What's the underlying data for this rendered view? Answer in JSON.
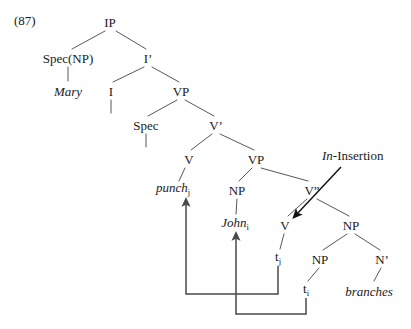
{
  "figure": {
    "example_number": "(87)",
    "kind": "syntax-tree",
    "annotation_label_italic": "In",
    "annotation_label_rest": "-Insertion"
  },
  "colors": {
    "background": "#ffffff",
    "ink": "#1a1a1a",
    "branch_line": "#444444",
    "movement_arrow": "#4a4a4a",
    "insertion_arrow": "#111111"
  },
  "tree": {
    "nodes": [
      {
        "id": "ip",
        "label": "IP",
        "x": 110,
        "y": 22,
        "italic": false,
        "sub": ""
      },
      {
        "id": "specnp",
        "label": "Spec(NP)",
        "x": 68,
        "y": 58,
        "italic": false,
        "sub": ""
      },
      {
        "id": "ibar",
        "label": "I’",
        "x": 148,
        "y": 58,
        "italic": false,
        "sub": ""
      },
      {
        "id": "mary",
        "label": "Mary",
        "x": 68,
        "y": 91,
        "italic": true,
        "sub": ""
      },
      {
        "id": "i",
        "label": "I",
        "x": 111,
        "y": 91,
        "italic": false,
        "sub": ""
      },
      {
        "id": "vp1",
        "label": "VP",
        "x": 181,
        "y": 91,
        "italic": false,
        "sub": ""
      },
      {
        "id": "spec",
        "label": "Spec",
        "x": 146,
        "y": 125,
        "italic": false,
        "sub": ""
      },
      {
        "id": "vbar",
        "label": "V’",
        "x": 216,
        "y": 125,
        "italic": false,
        "sub": ""
      },
      {
        "id": "v1",
        "label": "V",
        "x": 189,
        "y": 159,
        "italic": false,
        "sub": ""
      },
      {
        "id": "vp2",
        "label": "VP",
        "x": 256,
        "y": 159,
        "italic": false,
        "sub": ""
      },
      {
        "id": "punch",
        "label": "punch",
        "x": 173,
        "y": 190,
        "italic": true,
        "sub": "j"
      },
      {
        "id": "np1",
        "label": "NP",
        "x": 237,
        "y": 190,
        "italic": false,
        "sub": ""
      },
      {
        "id": "vdbl",
        "label": "V”",
        "x": 312,
        "y": 190,
        "italic": false,
        "sub": ""
      },
      {
        "id": "john",
        "label": "John",
        "x": 235,
        "y": 225,
        "italic": true,
        "sub": "i"
      },
      {
        "id": "v2",
        "label": "V",
        "x": 285,
        "y": 225,
        "italic": false,
        "sub": ""
      },
      {
        "id": "np2",
        "label": "NP",
        "x": 351,
        "y": 225,
        "italic": false,
        "sub": ""
      },
      {
        "id": "tj",
        "label": "t",
        "x": 278,
        "y": 259,
        "italic": false,
        "sub": "j"
      },
      {
        "id": "np3",
        "label": "NP",
        "x": 320,
        "y": 259,
        "italic": false,
        "sub": ""
      },
      {
        "id": "nbar",
        "label": "N’",
        "x": 382,
        "y": 259,
        "italic": false,
        "sub": ""
      },
      {
        "id": "ti",
        "label": "t",
        "x": 306,
        "y": 291,
        "italic": false,
        "sub": "i"
      },
      {
        "id": "branches",
        "label": "branches",
        "x": 369,
        "y": 291,
        "italic": true,
        "sub": ""
      }
    ],
    "branches": [
      {
        "from": "ip",
        "to": "specnp"
      },
      {
        "from": "ip",
        "to": "ibar"
      },
      {
        "from": "specnp",
        "to": "mary"
      },
      {
        "from": "ibar",
        "to": "i"
      },
      {
        "from": "ibar",
        "to": "vp1"
      },
      {
        "from": "i",
        "to": "i-empty"
      },
      {
        "from": "vp1",
        "to": "spec"
      },
      {
        "from": "vp1",
        "to": "vbar"
      },
      {
        "from": "spec",
        "to": "spec-empty"
      },
      {
        "from": "vbar",
        "to": "v1"
      },
      {
        "from": "vbar",
        "to": "vp2"
      },
      {
        "from": "v1",
        "to": "punch"
      },
      {
        "from": "vp2",
        "to": "np1"
      },
      {
        "from": "vp2",
        "to": "vdbl"
      },
      {
        "from": "np1",
        "to": "john"
      },
      {
        "from": "vdbl",
        "to": "v2"
      },
      {
        "from": "vdbl",
        "to": "np2"
      },
      {
        "from": "v2",
        "to": "tj"
      },
      {
        "from": "np2",
        "to": "np3"
      },
      {
        "from": "np2",
        "to": "nbar"
      },
      {
        "from": "np3",
        "to": "ti"
      },
      {
        "from": "nbar",
        "to": "branches"
      }
    ],
    "movements": [
      {
        "id": "move-tj-to-punch",
        "trace": "tj",
        "target": "punch"
      },
      {
        "id": "move-ti-to-john",
        "trace": "ti",
        "target": "john"
      }
    ]
  }
}
